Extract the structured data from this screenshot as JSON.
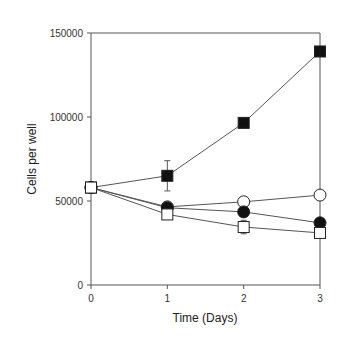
{
  "chart_data": {
    "type": "line",
    "title": "",
    "xlabel": "Time (Days)",
    "ylabel": "Cells per well",
    "x": [
      0,
      1,
      2,
      3
    ],
    "xlim": [
      0,
      3
    ],
    "ylim": [
      0,
      150000
    ],
    "xticks": [
      "0",
      "1",
      "2",
      "3"
    ],
    "yticks": [
      "0",
      "50000",
      "100000",
      "150000"
    ],
    "grid": false,
    "legend": null,
    "series": [
      {
        "name": "filled-square",
        "marker": "square-filled",
        "values": [
          58000,
          65000,
          96500,
          139000
        ],
        "errors": [
          0,
          9000,
          0,
          0
        ]
      },
      {
        "name": "open-circle",
        "marker": "circle-open",
        "values": [
          58000,
          46500,
          49500,
          53500
        ],
        "errors": [
          0,
          0,
          0,
          0
        ]
      },
      {
        "name": "filled-circle",
        "marker": "circle-filled",
        "values": [
          58000,
          46000,
          43500,
          37000
        ],
        "errors": [
          0,
          3000,
          0,
          0
        ]
      },
      {
        "name": "open-square",
        "marker": "square-open",
        "values": [
          58000,
          42000,
          34500,
          31000
        ],
        "errors": [
          0,
          3000,
          4000,
          0
        ]
      }
    ]
  }
}
